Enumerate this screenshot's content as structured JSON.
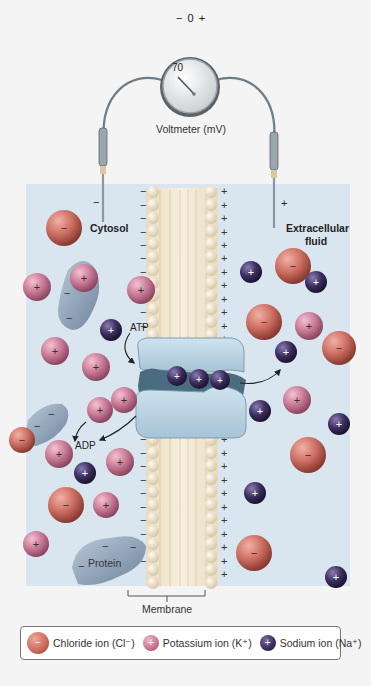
{
  "voltmeter": {
    "scale_minus": "−",
    "scale_zero": "0",
    "scale_plus": "+",
    "reading": "70",
    "label": "Voltmeter (mV)"
  },
  "electrodes": {
    "left_sign": "−",
    "right_sign": "+"
  },
  "regions": {
    "cytosol": "Cytosol",
    "extracellular_line1": "Extracellular",
    "extracellular_line2": "fluid",
    "membrane": "Membrane",
    "protein": "Protein"
  },
  "pump": {
    "atp_label": "ATP",
    "adp_label": "ADP"
  },
  "legend": {
    "items": [
      {
        "label": "Chloride ion (Cl⁻)",
        "sign": "−",
        "color": "#c9685c"
      },
      {
        "label": "Potassium ion (K⁺)",
        "sign": "+",
        "color": "#c7728f"
      },
      {
        "label": "Sodium ion (Na⁺)",
        "sign": "+",
        "color": "#3a2c5c"
      }
    ]
  },
  "colors": {
    "chloride": "#c9685c",
    "potassium": "#c7728f",
    "sodium": "#3a2c5c",
    "protein": "#8fa3b8",
    "pump": "#b7d2e4",
    "fluid_bg": "#d9e6ef",
    "phospholipid_head": "#f1e3c9"
  }
}
